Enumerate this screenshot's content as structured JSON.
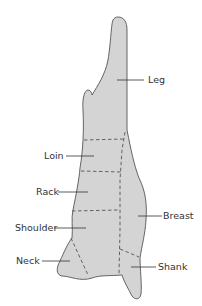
{
  "diagram": {
    "colors": {
      "fill": "#d4d4d4",
      "outline": "#555555",
      "dash": "#555555",
      "text": "#333333"
    },
    "labels": [
      {
        "id": "leg",
        "text": "Leg"
      },
      {
        "id": "loin",
        "text": "Loin"
      },
      {
        "id": "rack",
        "text": "Rack"
      },
      {
        "id": "shoulder",
        "text": "Shoulder"
      },
      {
        "id": "breast",
        "text": "Breast"
      },
      {
        "id": "neck",
        "text": "Neck"
      },
      {
        "id": "shank",
        "text": "Shank"
      }
    ]
  }
}
